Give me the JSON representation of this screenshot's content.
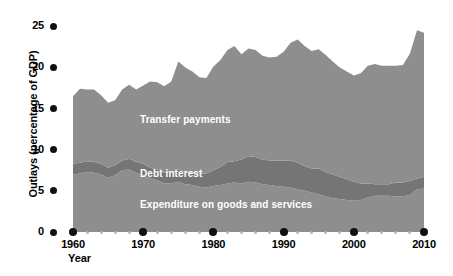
{
  "chart_data": {
    "type": "area",
    "stacked": true,
    "title": "",
    "xlabel": "Year",
    "ylabel": "Outlays (percentage of GDP)",
    "xlim": [
      1960,
      2010
    ],
    "ylim": [
      0,
      26
    ],
    "grid": false,
    "legend_position": "inline-band-labels",
    "xticks": [
      1960,
      1970,
      1980,
      1990,
      2000,
      2010
    ],
    "xtick_labels": [
      "1960",
      "1970",
      "1980",
      "1990",
      "2000",
      "2010"
    ],
    "yticks": [
      0,
      5,
      10,
      15,
      20,
      25
    ],
    "ytick_labels": [
      "0",
      "5",
      "10",
      "15",
      "20",
      "25"
    ],
    "x": [
      1960,
      1961,
      1962,
      1963,
      1964,
      1965,
      1966,
      1967,
      1968,
      1969,
      1970,
      1971,
      1972,
      1973,
      1974,
      1975,
      1976,
      1977,
      1978,
      1979,
      1980,
      1981,
      1982,
      1983,
      1984,
      1985,
      1986,
      1987,
      1988,
      1989,
      1990,
      1991,
      1992,
      1993,
      1994,
      1995,
      1996,
      1997,
      1998,
      1999,
      2000,
      2001,
      2002,
      2003,
      2004,
      2005,
      2006,
      2007,
      2008,
      2009,
      2010
    ],
    "series": [
      {
        "name": "Expenditure on goods and services",
        "color": "#8e8e8e",
        "values": [
          7.0,
          7.1,
          7.3,
          7.2,
          7.0,
          6.6,
          6.9,
          7.5,
          7.6,
          7.2,
          6.9,
          6.5,
          6.3,
          5.9,
          5.9,
          6.1,
          5.8,
          5.7,
          5.5,
          5.4,
          5.6,
          5.7,
          5.9,
          6.0,
          5.9,
          6.1,
          6.0,
          5.8,
          5.7,
          5.6,
          5.5,
          5.4,
          5.2,
          5.0,
          4.8,
          4.6,
          4.3,
          4.1,
          4.0,
          3.9,
          3.8,
          3.9,
          4.2,
          4.4,
          4.4,
          4.4,
          4.3,
          4.3,
          4.5,
          5.2,
          5.3
        ]
      },
      {
        "name": "Debt interest",
        "color": "#757575",
        "values": [
          1.3,
          1.3,
          1.3,
          1.3,
          1.3,
          1.2,
          1.2,
          1.2,
          1.3,
          1.3,
          1.4,
          1.3,
          1.3,
          1.3,
          1.4,
          1.5,
          1.5,
          1.5,
          1.6,
          1.7,
          1.9,
          2.2,
          2.6,
          2.6,
          2.9,
          3.1,
          3.1,
          3.0,
          3.0,
          3.1,
          3.2,
          3.3,
          3.2,
          3.0,
          2.9,
          3.1,
          3.0,
          2.9,
          2.7,
          2.5,
          2.3,
          2.0,
          1.7,
          1.4,
          1.4,
          1.4,
          1.7,
          1.7,
          1.7,
          1.3,
          1.4
        ]
      },
      {
        "name": "Transfer payments",
        "color": "#8e8e8e",
        "values": [
          8.2,
          9.0,
          8.7,
          8.8,
          8.3,
          7.9,
          7.9,
          8.6,
          9.0,
          8.8,
          9.5,
          10.5,
          10.6,
          10.5,
          11.0,
          13.1,
          12.7,
          12.3,
          11.7,
          11.6,
          12.6,
          13.0,
          13.6,
          14.0,
          12.8,
          13.1,
          13.0,
          12.6,
          12.5,
          12.6,
          13.2,
          14.3,
          15.0,
          14.6,
          14.3,
          14.5,
          14.2,
          13.7,
          13.3,
          13.1,
          12.9,
          13.4,
          14.3,
          14.6,
          14.4,
          14.4,
          14.2,
          14.3,
          15.5,
          18.0,
          17.5
        ]
      }
    ],
    "band_labels": [
      {
        "id": "transfer",
        "text": "Transfer payments"
      },
      {
        "id": "debt",
        "text": "Debt interest"
      },
      {
        "id": "expenditure",
        "text": "Expenditure on goods and services"
      }
    ],
    "colors": {
      "transfer_payments": "#8e8e8e",
      "debt_interest": "#757575",
      "expenditure": "#8e8e8e",
      "axis_text": "#000000",
      "tick_dot": "#111111",
      "background": "#ffffff",
      "band_label_text": "#ffffff"
    }
  }
}
